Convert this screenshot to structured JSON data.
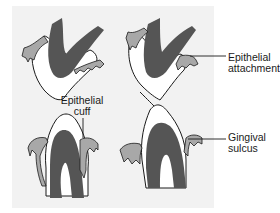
{
  "figure": {
    "colors": {
      "background_panel": "#f2f2f2",
      "tooth_dark": "#555555",
      "enamel_white": "#ffffff",
      "gingiva": "#a8a8a8",
      "outline": "#1a1a1a"
    },
    "labels": {
      "epithelial_attachment": [
        "Epithelial",
        "attachment"
      ],
      "epithelial_cuff": [
        "Epithelial",
        "cuff"
      ],
      "gingival_sulcus": [
        "Gingival",
        "sulcus"
      ]
    }
  }
}
